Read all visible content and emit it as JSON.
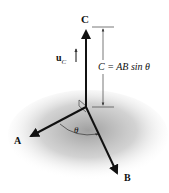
{
  "diagram": {
    "labels": {
      "c": "C",
      "a": "A",
      "b": "B",
      "uc_main": "u",
      "uc_sub": "C",
      "equation": "C = AB sin θ",
      "theta": "θ"
    },
    "colors": {
      "vector": "#111111",
      "shadow": "#9a9a9a",
      "dimension_line": "#555555",
      "background": "#ffffff"
    }
  }
}
